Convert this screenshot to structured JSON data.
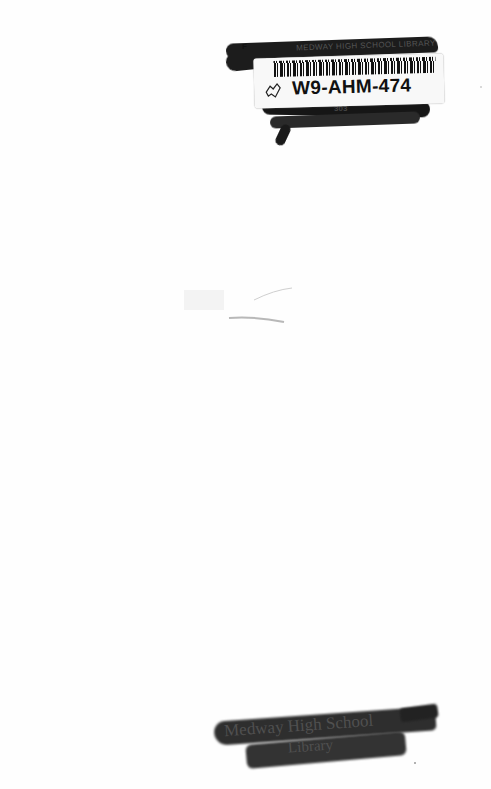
{
  "document": {
    "type": "book-inside-cover-scan",
    "top_stamp": {
      "corner_mark": "F",
      "library_text": "MEDWAY HIGH SCHOOL LIBRARY",
      "obscured_number": "303"
    },
    "barcode_label": {
      "icon": "book-outline-icon",
      "code": "W9-AHM-474"
    },
    "bottom_stamp": {
      "line1": "Medway High School",
      "line2": "Library"
    }
  },
  "colors": {
    "page": "#fefefe",
    "marker": "#1c1c1c",
    "label": "#f8f8f8",
    "text": "#111111"
  }
}
